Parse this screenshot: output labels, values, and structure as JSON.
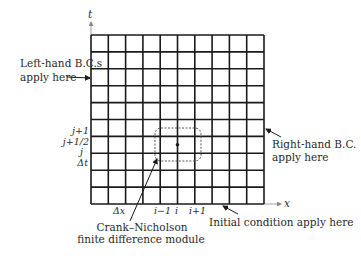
{
  "diagram": {
    "colors": {
      "background": "#ffffff",
      "grid_line": "#1a1a1a",
      "text": "#2a2a2a",
      "dashed_box": "#555555"
    },
    "grid": {
      "columns": 10,
      "rows": 10,
      "x_left": 91,
      "x_right": 264,
      "y_top": 35,
      "y_bottom": 204
    },
    "axes": {
      "t_label": "t",
      "x_label": "x"
    },
    "left_labels": {
      "j_plus_1": "j+1",
      "j_plus_half": "j+1/2",
      "j": "j",
      "delta_t": "Δt"
    },
    "bottom_labels": {
      "delta_x": "Δx",
      "i_minus_1": "i−1",
      "i": "i",
      "i_plus_1": "i+1"
    },
    "annotations": {
      "left_bc_line1": "Left-hand B.C.s",
      "left_bc_line2": "apply here",
      "right_bc_line1": "Right-hand B.C.",
      "right_bc_line2": "apply here",
      "initial_condition": "Initial condition apply here",
      "cn_module_line1": "Crank–Nicholson",
      "cn_module_line2": "finite difference module"
    }
  }
}
